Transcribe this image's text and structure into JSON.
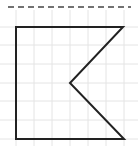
{
  "figure": {
    "colors": {
      "background": "#ffffff",
      "grid": "#e4e4e4",
      "shape_stroke": "#222222",
      "dashed_line": "#444444"
    },
    "grid": {
      "x_lines": [
        16,
        34,
        52,
        70,
        88,
        106,
        124
      ],
      "y_lines": [
        27,
        45,
        64,
        83,
        101,
        120,
        139
      ],
      "x_range": [
        0,
        138
      ],
      "y_range": [
        10,
        146
      ]
    },
    "dashed_line": {
      "x1": 8,
      "y1": 7,
      "x2": 131,
      "y2": 7,
      "dash": "6,4"
    },
    "shape": {
      "points": [
        [
          16,
          27
        ],
        [
          123,
          27
        ],
        [
          70,
          83
        ],
        [
          124,
          139
        ],
        [
          16,
          139
        ]
      ]
    }
  }
}
